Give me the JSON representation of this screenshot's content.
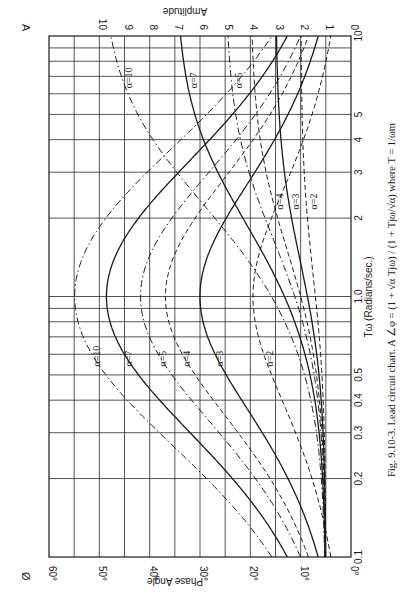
{
  "figure": {
    "caption": "Fig. 9.10-3.  Lead circuit chart.  A ∠φ = (1 + √α Tjω) / (1 + Tjω/√α)  where T = 1/ωm",
    "corner_left_symbol": "Ø",
    "corner_right_symbol": "A",
    "orientation": "rotated 90° (frequency axis runs vertically, phase/amplitude horizontally)"
  },
  "axes": {
    "frequency_title": "Tω (Radians/sec.)",
    "frequency_ticks": [
      "0.1",
      "0.2",
      "0.3",
      "0.4",
      "0.5",
      "1.0",
      "2",
      "3",
      "4",
      "5",
      "10"
    ],
    "phase_title": "Phase Angle",
    "phase_ticks": [
      "0°",
      "10°",
      "20°",
      "30°",
      "40°",
      "50°",
      "60°"
    ],
    "amplitude_title": "Amplitude",
    "amplitude_ticks": [
      "0",
      "1",
      "2",
      "3",
      "4",
      "5",
      "6",
      "7",
      "8",
      "9",
      "10"
    ]
  },
  "chart_data": {
    "type": "line",
    "title": "Lead circuit chart",
    "xlabel": "Tω (Radians/sec.)",
    "x_scale": "log",
    "xlim": [
      0.1,
      10
    ],
    "ylabel_left": "Phase Angle (degrees)",
    "ylim_left": [
      0,
      60
    ],
    "ylabel_right": "Amplitude",
    "ylim_right": [
      0,
      10
    ],
    "grid": true,
    "x": [
      0.1,
      0.2,
      0.5,
      1.0,
      2.0,
      5.0,
      10.0
    ],
    "series": [
      {
        "name": "Phase α=2",
        "axis": "phase",
        "style": "dashed",
        "values": [
          5.7,
          11.0,
          18.4,
          19.5,
          18.4,
          11.0,
          5.7
        ]
      },
      {
        "name": "Phase α=3",
        "axis": "phase",
        "style": "solid",
        "values": [
          9.8,
          18.6,
          28.4,
          30.0,
          28.4,
          18.6,
          9.8
        ]
      },
      {
        "name": "Phase α=4",
        "axis": "phase",
        "style": "dashed",
        "values": [
          14.1,
          25.3,
          34.9,
          36.9,
          34.9,
          25.3,
          14.1
        ]
      },
      {
        "name": "Phase α=5",
        "axis": "phase",
        "style": "dashdot",
        "values": [
          17.6,
          30.6,
          39.4,
          41.8,
          39.4,
          30.6,
          17.6
        ]
      },
      {
        "name": "Phase α=7",
        "axis": "phase",
        "style": "solid",
        "values": [
          23.5,
          37.6,
          45.6,
          48.6,
          45.6,
          37.6,
          23.5
        ]
      },
      {
        "name": "Phase α=10",
        "axis": "phase",
        "style": "dashdot",
        "values": [
          29.4,
          43.5,
          51.3,
          54.9,
          51.3,
          43.5,
          29.4
        ]
      },
      {
        "name": "Amplitude α=2",
        "axis": "amplitude",
        "style": "dashed",
        "values": [
          1.01,
          1.04,
          1.22,
          1.41,
          1.63,
          1.92,
          1.98
        ]
      },
      {
        "name": "Amplitude α=3",
        "axis": "amplitude",
        "style": "solid",
        "values": [
          1.01,
          1.06,
          1.39,
          1.73,
          2.16,
          2.79,
          2.95
        ]
      },
      {
        "name": "Amplitude α=4",
        "axis": "amplitude",
        "style": "dashed",
        "values": [
          1.02,
          1.09,
          1.49,
          2.0,
          2.68,
          3.68,
          3.92
        ]
      },
      {
        "name": "Amplitude α=5",
        "axis": "amplitude",
        "style": "dashdot",
        "values": [
          1.02,
          1.1,
          1.56,
          2.24,
          3.19,
          4.55,
          4.88
        ]
      },
      {
        "name": "Amplitude α=7",
        "axis": "amplitude",
        "style": "solid",
        "values": [
          1.02,
          1.13,
          1.65,
          2.65,
          4.24,
          6.23,
          6.79
        ]
      },
      {
        "name": "Amplitude α=10",
        "axis": "amplitude",
        "style": "dashdot",
        "values": [
          1.03,
          1.16,
          1.75,
          3.16,
          5.7,
          8.66,
          9.5
        ]
      }
    ],
    "curve_labels": {
      "phase": [
        "α=10",
        "α=7",
        "α=5",
        "α=4",
        "α=3",
        "α=2"
      ],
      "amplitude": [
        "α=10",
        "α=7",
        "α=5",
        "α=4",
        "α=3",
        "α=2"
      ]
    },
    "alphas": [
      {
        "alpha": 2,
        "label": "α=2",
        "style": "dashed"
      },
      {
        "alpha": 3,
        "label": "α=3",
        "style": "solid"
      },
      {
        "alpha": 4,
        "label": "α=4",
        "style": "dashed"
      },
      {
        "alpha": 5,
        "label": "α=5",
        "style": "dashdot"
      },
      {
        "alpha": 7,
        "label": "α=7",
        "style": "solid"
      },
      {
        "alpha": 10,
        "label": "α=10",
        "style": "dashdot"
      }
    ]
  }
}
